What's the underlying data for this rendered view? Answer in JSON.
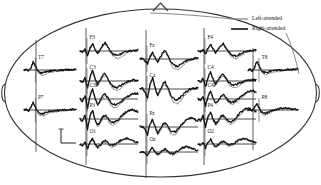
{
  "figure": {
    "type": "erp-topographic-montage",
    "head_outline": "ellipse with nose triangle at top and ear bumps at left and right"
  },
  "legend": {
    "items": [
      {
        "label": "Left-attended",
        "color": "#8c8c8c",
        "name": "left-attended"
      },
      {
        "label": "Right-attended",
        "color": "#111111",
        "name": "right-attended"
      }
    ]
  },
  "scale_bar": {
    "amplitude_label": "4μV",
    "time_label": "100ms"
  },
  "chart_data": {
    "type": "line",
    "title": "",
    "xlabel": "",
    "ylabel": "",
    "xlim": [
      -100,
      600
    ],
    "ylim": [
      -8,
      8
    ],
    "grid": false,
    "legend_position": "top-right",
    "x_unit": "ms",
    "y_unit": "μV",
    "scale_amplitude_uv": 4,
    "scale_time_ms": 100,
    "series_names": [
      "Left-attended",
      "Right-attended"
    ],
    "series_colors": [
      "#8c8c8c",
      "#111111"
    ],
    "panels": [
      {
        "electrode": "F3",
        "x": 80,
        "y": 36,
        "w": 58,
        "h": 30,
        "axis_x": 0.12,
        "left": [
          0.0,
          -0.2,
          0.3,
          -1.1,
          0.6,
          2.2,
          0.4,
          -0.9,
          0.2,
          1.6,
          2.4,
          1.2,
          -0.4,
          -1.6,
          -2.3,
          -2.6,
          -2.2,
          -1.6,
          -1.0,
          -0.6,
          -0.3,
          -0.1,
          0.1,
          0.2
        ],
        "right": [
          0.0,
          -0.3,
          0.5,
          -1.4,
          1.0,
          2.6,
          0.6,
          -0.7,
          0.5,
          2.0,
          2.8,
          1.5,
          -0.1,
          -1.0,
          -1.4,
          -1.5,
          -1.2,
          -0.8,
          -0.4,
          -0.2,
          0.0,
          0.2,
          0.3,
          0.3
        ]
      },
      {
        "electrode": "Fz",
        "x": 140,
        "y": 44,
        "w": 58,
        "h": 30,
        "axis_x": 0.12,
        "left": [
          0.0,
          0.2,
          -0.4,
          -1.6,
          0.4,
          2.0,
          0.2,
          -1.2,
          0.0,
          1.8,
          2.6,
          1.0,
          -1.2,
          -2.8,
          -3.6,
          -3.8,
          -3.2,
          -2.4,
          -1.6,
          -0.9,
          -0.4,
          -0.1,
          0.1,
          0.2
        ],
        "right": [
          0.0,
          0.1,
          -0.6,
          -1.8,
          0.8,
          2.4,
          0.4,
          -0.9,
          0.4,
          2.2,
          3.0,
          1.4,
          -0.6,
          -1.8,
          -2.4,
          -2.5,
          -2.0,
          -1.4,
          -0.8,
          -0.4,
          -0.1,
          0.1,
          0.3,
          0.3
        ]
      },
      {
        "electrode": "F4",
        "x": 198,
        "y": 36,
        "w": 58,
        "h": 30,
        "axis_x": 0.12,
        "left": [
          0.0,
          -0.2,
          0.4,
          -1.0,
          0.7,
          2.0,
          0.5,
          -0.8,
          0.3,
          1.5,
          2.2,
          1.0,
          -0.6,
          -1.8,
          -2.4,
          -2.6,
          -2.2,
          -1.6,
          -1.0,
          -0.5,
          -0.2,
          0.0,
          0.2,
          0.2
        ],
        "right": [
          0.0,
          -0.3,
          0.6,
          -1.2,
          1.1,
          2.4,
          0.7,
          -0.6,
          0.6,
          1.9,
          2.6,
          1.3,
          -0.2,
          -1.1,
          -1.5,
          -1.6,
          -1.3,
          -0.9,
          -0.5,
          -0.2,
          0.0,
          0.2,
          0.3,
          0.3
        ]
      },
      {
        "electrode": "T7",
        "x": 24,
        "y": 56,
        "w": 52,
        "h": 28,
        "axis_x": 0.22,
        "left": [
          0.0,
          0.1,
          -0.2,
          0.4,
          2.6,
          1.4,
          -0.6,
          -1.6,
          -2.0,
          -1.8,
          -1.4,
          -1.0,
          -0.8,
          -0.7,
          -0.6,
          -0.5,
          -0.4,
          -0.3,
          -0.2,
          -0.1,
          0.0,
          0.1,
          0.1,
          0.1
        ],
        "right": [
          0.0,
          0.2,
          -0.3,
          0.6,
          3.0,
          1.6,
          -0.2,
          -0.9,
          -1.1,
          -0.9,
          -0.6,
          -0.4,
          -0.3,
          -0.2,
          -0.2,
          -0.1,
          -0.1,
          0.0,
          0.0,
          0.1,
          0.1,
          0.1,
          0.2,
          0.2
        ]
      },
      {
        "electrode": "C3",
        "x": 80,
        "y": 66,
        "w": 58,
        "h": 30,
        "axis_x": 0.12,
        "left": [
          0.0,
          -0.4,
          0.8,
          -2.2,
          1.0,
          3.2,
          0.2,
          -1.8,
          -0.4,
          1.4,
          2.0,
          0.6,
          -1.4,
          -2.6,
          -3.2,
          -3.2,
          -2.6,
          -1.8,
          -1.1,
          -0.6,
          -0.2,
          0.1,
          0.2,
          0.2
        ],
        "right": [
          0.0,
          -0.6,
          1.2,
          -2.8,
          1.6,
          3.8,
          0.6,
          -1.2,
          0.2,
          2.0,
          2.6,
          1.0,
          -0.8,
          -1.8,
          -2.2,
          -2.2,
          -1.7,
          -1.1,
          -0.6,
          -0.2,
          0.1,
          0.3,
          0.3,
          0.3
        ]
      },
      {
        "electrode": "Cz",
        "x": 140,
        "y": 74,
        "w": 58,
        "h": 30,
        "axis_x": 0.12,
        "left": [
          0.0,
          0.4,
          -1.0,
          -2.8,
          1.2,
          3.4,
          0.0,
          -2.6,
          -1.0,
          1.0,
          1.6,
          -0.2,
          -2.6,
          -4.2,
          -5.0,
          -5.0,
          -4.2,
          -3.0,
          -1.9,
          -1.0,
          -0.4,
          0.0,
          0.2,
          0.2
        ],
        "right": [
          0.0,
          0.3,
          -1.2,
          -3.0,
          1.8,
          4.0,
          0.4,
          -2.0,
          -0.4,
          1.8,
          2.4,
          0.4,
          -1.8,
          -3.0,
          -3.6,
          -3.6,
          -2.9,
          -2.0,
          -1.2,
          -0.5,
          0.0,
          0.2,
          0.3,
          0.3
        ]
      },
      {
        "electrode": "C4",
        "x": 198,
        "y": 66,
        "w": 58,
        "h": 30,
        "axis_x": 0.12,
        "left": [
          0.0,
          -0.3,
          0.7,
          -1.8,
          0.9,
          2.8,
          0.3,
          -1.4,
          -0.2,
          1.2,
          1.8,
          0.8,
          -0.8,
          -1.8,
          -2.2,
          -2.2,
          -1.8,
          -1.2,
          -0.7,
          -0.3,
          0.0,
          0.2,
          0.3,
          0.3
        ],
        "right": [
          0.0,
          -0.5,
          1.0,
          -2.2,
          1.4,
          3.2,
          0.5,
          -1.0,
          0.3,
          1.7,
          2.3,
          1.2,
          -0.3,
          -1.0,
          -1.3,
          -1.2,
          -0.9,
          -0.5,
          -0.2,
          0.1,
          0.3,
          0.4,
          0.4,
          0.4
        ]
      },
      {
        "electrode": "C3P",
        "x": 80,
        "y": 84,
        "w": 58,
        "h": 30,
        "axis_x": 0.12,
        "left": [
          0.0,
          -0.6,
          1.0,
          -2.6,
          0.8,
          3.0,
          -0.2,
          -2.4,
          -1.2,
          0.6,
          1.2,
          0.0,
          -1.8,
          -2.8,
          -3.0,
          -2.6,
          -1.8,
          -0.9,
          -0.1,
          0.6,
          1.2,
          1.6,
          1.8,
          1.7
        ],
        "right": [
          0.0,
          -0.8,
          1.4,
          -3.2,
          1.4,
          3.6,
          0.2,
          -1.8,
          -0.6,
          1.2,
          1.8,
          0.6,
          -1.0,
          -1.8,
          -2.0,
          -1.7,
          -1.1,
          -0.4,
          0.3,
          0.9,
          1.4,
          1.8,
          2.0,
          1.9
        ]
      },
      {
        "electrode": "C4P",
        "x": 198,
        "y": 84,
        "w": 58,
        "h": 30,
        "axis_x": 0.12,
        "left": [
          0.0,
          -0.4,
          0.8,
          -2.0,
          0.6,
          2.4,
          -0.2,
          -1.8,
          -0.9,
          0.4,
          1.0,
          0.2,
          -1.2,
          -1.8,
          -1.8,
          -1.2,
          -0.4,
          0.4,
          1.2,
          1.9,
          2.4,
          2.6,
          2.5,
          2.2
        ],
        "right": [
          0.0,
          -0.6,
          1.1,
          -2.4,
          1.0,
          2.8,
          0.1,
          -1.4,
          -0.4,
          0.9,
          1.5,
          0.6,
          -0.6,
          -1.1,
          -1.1,
          -0.6,
          0.1,
          0.8,
          1.6,
          2.2,
          2.7,
          2.9,
          2.8,
          2.5
        ]
      },
      {
        "electrode": "P7",
        "x": 24,
        "y": 96,
        "w": 52,
        "h": 28,
        "axis_x": 0.22,
        "left": [
          0.0,
          0.2,
          -0.4,
          0.8,
          2.4,
          1.0,
          -1.0,
          -2.0,
          -2.2,
          -1.9,
          -1.5,
          -1.1,
          -0.9,
          -0.8,
          -0.7,
          -0.6,
          -0.5,
          -0.4,
          -0.3,
          -0.2,
          -0.1,
          0.0,
          0.1,
          0.1
        ],
        "right": [
          0.0,
          0.3,
          -0.5,
          1.0,
          2.8,
          1.2,
          -0.6,
          -1.3,
          -1.4,
          -1.1,
          -0.8,
          -0.5,
          -0.4,
          -0.3,
          -0.2,
          -0.2,
          -0.1,
          0.0,
          0.0,
          0.1,
          0.1,
          0.2,
          0.2,
          0.2
        ]
      },
      {
        "electrode": "P3",
        "x": 80,
        "y": 104,
        "w": 58,
        "h": 30,
        "axis_x": 0.12,
        "left": [
          0.0,
          -0.6,
          1.2,
          -3.0,
          0.6,
          2.6,
          -0.6,
          -2.8,
          -1.6,
          0.2,
          0.8,
          -0.2,
          -1.6,
          -2.0,
          -1.8,
          -1.0,
          0.0,
          1.0,
          1.9,
          2.6,
          3.0,
          3.0,
          2.7,
          2.3
        ],
        "right": [
          0.0,
          -0.9,
          1.6,
          -3.6,
          1.2,
          3.2,
          -0.2,
          -2.2,
          -1.0,
          0.8,
          1.4,
          0.4,
          -0.9,
          -1.2,
          -1.0,
          -0.3,
          0.6,
          1.5,
          2.3,
          2.9,
          3.2,
          3.2,
          2.9,
          2.5
        ]
      },
      {
        "electrode": "Pz",
        "x": 140,
        "y": 112,
        "w": 58,
        "h": 30,
        "axis_x": 0.12,
        "left": [
          0.0,
          0.3,
          -0.8,
          -2.2,
          0.8,
          2.4,
          -0.4,
          -2.6,
          -1.4,
          0.4,
          0.9,
          -0.4,
          -2.0,
          -2.8,
          -2.6,
          -1.6,
          -0.2,
          1.0,
          2.0,
          2.8,
          3.2,
          3.1,
          2.6,
          2.0
        ],
        "right": [
          0.0,
          0.2,
          -1.0,
          -2.6,
          1.2,
          2.8,
          0.0,
          -2.0,
          -0.8,
          1.0,
          1.5,
          0.2,
          -1.2,
          -1.8,
          -1.6,
          -0.8,
          0.3,
          1.4,
          2.3,
          2.9,
          3.1,
          3.0,
          2.5,
          1.9
        ]
      },
      {
        "electrode": "P4",
        "x": 198,
        "y": 104,
        "w": 58,
        "h": 30,
        "axis_x": 0.12,
        "left": [
          0.0,
          -0.5,
          0.9,
          -2.4,
          0.5,
          2.2,
          -0.5,
          -2.2,
          -1.2,
          0.3,
          0.8,
          -0.2,
          -1.4,
          -1.8,
          -1.4,
          -0.4,
          0.8,
          1.8,
          2.6,
          3.2,
          3.4,
          3.2,
          2.8,
          2.4
        ],
        "right": [
          0.0,
          -0.7,
          1.2,
          -2.8,
          1.0,
          2.6,
          -0.1,
          -1.6,
          -0.6,
          0.9,
          1.4,
          0.4,
          -0.7,
          -1.0,
          -0.6,
          0.4,
          1.5,
          2.4,
          3.0,
          3.5,
          3.6,
          3.4,
          3.0,
          2.6
        ]
      },
      {
        "electrode": "T8",
        "x": 248,
        "y": 56,
        "w": 50,
        "h": 28,
        "axis_x": 0.22,
        "left": [
          0.0,
          0.1,
          -0.3,
          0.6,
          2.8,
          1.6,
          -0.4,
          -1.4,
          -1.8,
          -1.6,
          -1.2,
          -0.9,
          -0.7,
          -0.6,
          -0.5,
          -0.4,
          -0.3,
          -0.2,
          -0.1,
          0.0,
          0.1,
          0.1,
          0.2,
          0.2
        ],
        "right": [
          0.0,
          0.2,
          -0.4,
          0.8,
          3.2,
          1.8,
          0.0,
          -0.8,
          -1.0,
          -0.8,
          -0.5,
          -0.3,
          -0.2,
          -0.1,
          -0.1,
          0.0,
          0.0,
          0.1,
          0.1,
          0.2,
          0.2,
          0.2,
          0.3,
          0.3
        ]
      },
      {
        "electrode": "P8",
        "x": 248,
        "y": 96,
        "w": 50,
        "h": 28,
        "axis_x": 0.22,
        "left": [
          0.0,
          0.2,
          -0.4,
          0.7,
          2.2,
          0.9,
          -0.9,
          -1.8,
          -1.9,
          -1.5,
          -1.0,
          -0.6,
          -0.3,
          -0.1,
          0.1,
          0.3,
          0.4,
          0.5,
          0.5,
          0.4,
          0.3,
          0.2,
          0.2,
          0.1
        ],
        "right": [
          0.0,
          0.3,
          -0.5,
          0.9,
          2.6,
          1.1,
          -0.5,
          -1.2,
          -1.2,
          -0.9,
          -0.5,
          -0.2,
          0.0,
          0.2,
          0.4,
          0.6,
          0.7,
          0.7,
          0.6,
          0.5,
          0.4,
          0.3,
          0.3,
          0.2
        ]
      },
      {
        "electrode": "O1",
        "x": 80,
        "y": 130,
        "w": 58,
        "h": 28,
        "axis_x": 0.12,
        "left": [
          0.0,
          -0.3,
          0.6,
          -1.4,
          0.4,
          1.6,
          -0.4,
          -1.6,
          -0.9,
          0.3,
          0.7,
          -0.1,
          -0.9,
          -1.1,
          -0.7,
          0.1,
          0.9,
          1.5,
          1.8,
          1.8,
          1.5,
          1.1,
          0.7,
          0.4
        ],
        "right": [
          0.0,
          -0.5,
          0.9,
          -1.8,
          0.8,
          2.0,
          -0.1,
          -1.1,
          -0.4,
          0.8,
          1.2,
          0.4,
          -0.3,
          -0.5,
          -0.1,
          0.6,
          1.3,
          1.8,
          2.0,
          2.0,
          1.7,
          1.3,
          0.9,
          0.6
        ]
      },
      {
        "electrode": "Oz",
        "x": 140,
        "y": 138,
        "w": 58,
        "h": 28,
        "axis_x": 0.12,
        "left": [
          0.0,
          0.2,
          -0.5,
          -1.2,
          0.5,
          1.4,
          -0.3,
          -1.4,
          -0.8,
          0.2,
          0.6,
          -0.2,
          -1.0,
          -1.2,
          -0.8,
          0.0,
          0.8,
          1.4,
          1.7,
          1.7,
          1.4,
          1.0,
          0.6,
          0.3
        ],
        "right": [
          0.0,
          0.1,
          -0.6,
          -1.4,
          0.8,
          1.7,
          0.0,
          -0.9,
          -0.3,
          0.7,
          1.0,
          0.2,
          -0.5,
          -0.6,
          -0.2,
          0.5,
          1.2,
          1.7,
          1.9,
          1.9,
          1.6,
          1.2,
          0.8,
          0.5
        ]
      },
      {
        "electrode": "O2",
        "x": 198,
        "y": 130,
        "w": 58,
        "h": 28,
        "axis_x": 0.12,
        "left": [
          0.0,
          -0.3,
          0.5,
          -1.2,
          0.4,
          1.4,
          -0.3,
          -1.3,
          -0.7,
          0.3,
          0.7,
          0.0,
          -0.7,
          -0.8,
          -0.4,
          0.3,
          1.0,
          1.5,
          1.7,
          1.6,
          1.3,
          0.9,
          0.6,
          0.3
        ],
        "right": [
          0.0,
          -0.4,
          0.7,
          -1.5,
          0.7,
          1.7,
          0.0,
          -0.9,
          -0.3,
          0.7,
          1.1,
          0.4,
          -0.2,
          -0.3,
          0.1,
          0.7,
          1.3,
          1.7,
          1.9,
          1.8,
          1.5,
          1.1,
          0.7,
          0.4
        ]
      }
    ]
  }
}
